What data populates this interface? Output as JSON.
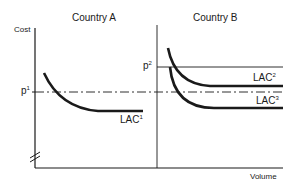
{
  "panels": [
    {
      "title": "Country A",
      "curves": [
        {
          "label": "LAC",
          "superscript": "1"
        }
      ]
    },
    {
      "title": "Country B",
      "curves": [
        {
          "label": "LAC",
          "superscript": "2"
        },
        {
          "label": "LAC",
          "superscript": "3"
        }
      ]
    }
  ],
  "axes": {
    "y_label": "Cost",
    "x_label": "Volume"
  },
  "price_levels": [
    {
      "label": "p",
      "superscript": "1",
      "style": "dash-dot"
    },
    {
      "label": "p",
      "superscript": "2",
      "style": "solid"
    }
  ],
  "colors": {
    "ink": "#1a1a1a",
    "background": "#ffffff"
  }
}
